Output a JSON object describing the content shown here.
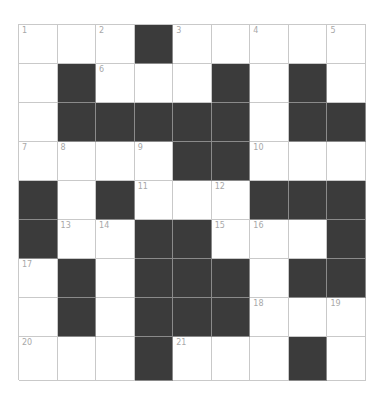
{
  "puzzle": {
    "rows": 9,
    "cols": 9,
    "colors": {
      "black": "#3b3b3b",
      "white": "#ffffff",
      "gridline": "#c9c9c9",
      "number": "#a8a8a8"
    },
    "grid": [
      [
        "1",
        "",
        "2",
        "#",
        "3",
        "",
        "4",
        "",
        "5"
      ],
      [
        "",
        "#",
        "6",
        "",
        "",
        "#",
        "",
        "#",
        ""
      ],
      [
        "",
        "#",
        "#",
        "#",
        "#",
        "#",
        "",
        "#",
        "#"
      ],
      [
        "7",
        "8",
        "",
        "9",
        "#",
        "#",
        "10",
        "",
        ""
      ],
      [
        "#",
        "",
        "#",
        "11",
        "",
        "12",
        "#",
        "#",
        "#"
      ],
      [
        "#",
        "13",
        "14",
        "#",
        "#",
        "15",
        "16",
        "",
        "#"
      ],
      [
        "17",
        "#",
        "",
        "#",
        "#",
        "#",
        "",
        "#",
        "#"
      ],
      [
        "",
        "#",
        "",
        "#",
        "#",
        "#",
        "18",
        "",
        "19"
      ],
      [
        "20",
        "",
        "",
        "#",
        "21",
        "",
        "",
        "#",
        ""
      ]
    ]
  }
}
